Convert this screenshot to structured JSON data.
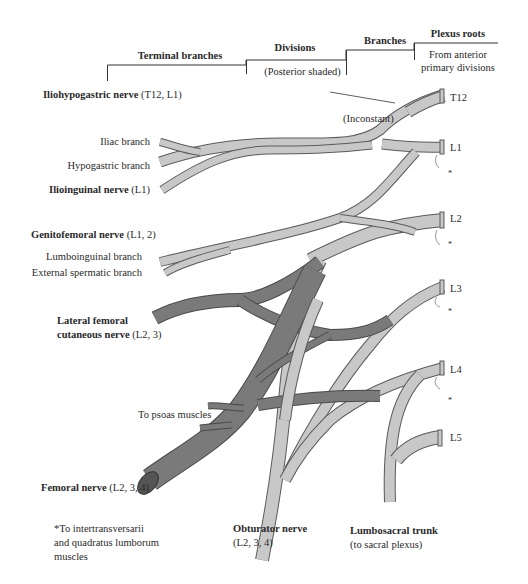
{
  "header": {
    "terminal_branches": "Terminal branches",
    "divisions": "Divisions",
    "divisions_note": "(Posterior shaded)",
    "branches": "Branches",
    "plexus_roots": "Plexus roots",
    "plexus_roots_note_line1": "From anterior",
    "plexus_roots_note_line2": "primary divisions"
  },
  "roots": [
    "T12",
    "L1",
    "L2",
    "L3",
    "L4",
    "L5"
  ],
  "labels": {
    "iliohypogastric_name": "Iliohypogastric nerve",
    "iliohypogastric_roots": " (T12, L1)",
    "inconstant": "(Inconstant)",
    "iliac_branch": "Iliac branch",
    "hypogastric_branch": "Hypogastric branch",
    "ilioinguinal_name": "Ilioinguinal nerve",
    "ilioinguinal_roots": " (L1)",
    "genitofemoral_name": "Genitofemoral nerve",
    "genitofemoral_roots": " (L1, 2)",
    "lumboinguinal_branch": "Lumboinguinal branch",
    "external_spermatic_branch": "External spermatic branch",
    "lateral_femoral_line1": "Lateral femoral",
    "lateral_femoral_line2": "cutaneous nerve",
    "lateral_femoral_roots": " (L2, 3)",
    "to_psoas": "To psoas muscles",
    "femoral_name": "Femoral nerve",
    "femoral_roots": " (L2, 3, 4)",
    "footnote_line1": "*To intertransversarii",
    "footnote_line2": "and quadratus lumborum",
    "footnote_line3": "muscles",
    "obturator_name": "Obturator nerve",
    "obturator_roots": "(L2, 3, 4)",
    "lumbosacral_name": "Lumbosacral trunk",
    "lumbosacral_note": "(to sacral plexus)",
    "asterisk": "*"
  },
  "colors": {
    "anterior_fill": "#c8c8c8",
    "posterior_fill": "#7a7a7a",
    "outline": "#5a5a5a",
    "text": "#2a2a2a"
  }
}
